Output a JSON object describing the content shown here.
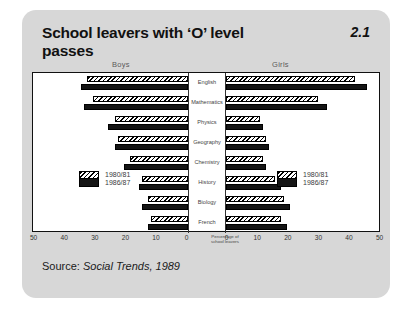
{
  "figure": {
    "title": "School leavers with ‘O’ level passes",
    "number": "2.1",
    "source": "Source: Social Trends, 1989",
    "source_prefix": "Source: ",
    "source_publication": "Social Trends, 1989"
  },
  "panels": {
    "left_header": "Boys",
    "right_header": "Girls"
  },
  "legend": {
    "old_label": "1980/81",
    "new_label": "1986/87"
  },
  "axis": {
    "title_line1": "Percentage of",
    "title_line2": "school leavers",
    "left_ticks": [
      "50",
      "40",
      "30",
      "20",
      "10",
      "0"
    ],
    "right_ticks": [
      "0",
      "10",
      "20",
      "30",
      "40",
      "50"
    ]
  },
  "colors": {
    "card_background": "#d7d7d7",
    "plot_background": "#ffffff",
    "bar_new": "#151515",
    "bar_old_hatch": "#000000",
    "text": "#111111",
    "label_text": "#444444"
  },
  "chart_data": {
    "type": "bar",
    "orientation": "horizontal-diverging",
    "title": "School leavers with ‘O’ level passes",
    "xlabel": "Percentage of school leavers",
    "ylabel": "",
    "xlim": [
      0,
      50
    ],
    "grid": false,
    "legend_position": "inside-left-and-right",
    "categories": [
      "English",
      "Mathematics",
      "Physics",
      "Geography",
      "Chemistry",
      "History",
      "Biology",
      "French"
    ],
    "panels": [
      {
        "name": "Boys",
        "direction": "left",
        "series": [
          {
            "name": "1980/81",
            "values": [
              33,
              31,
              24,
              23,
              19,
              15,
              13,
              12
            ]
          },
          {
            "name": "1986/87",
            "values": [
              35,
              34,
              26,
              24,
              21,
              16,
              15,
              13
            ]
          }
        ]
      },
      {
        "name": "Girls",
        "direction": "right",
        "series": [
          {
            "name": "1980/81",
            "values": [
              42,
              30,
              11,
              13,
              12,
              16,
              19,
              18
            ]
          },
          {
            "name": "1986/87",
            "values": [
              46,
              33,
              12,
              14,
              13,
              18,
              21,
              20
            ]
          }
        ]
      }
    ]
  }
}
